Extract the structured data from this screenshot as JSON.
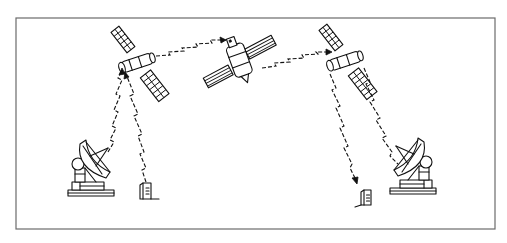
{
  "diagram": {
    "type": "satellite-relay-communication-illustration",
    "frame": {
      "stroke_color": "#6b6b6b",
      "background": "#ffffff"
    },
    "ink_color": "#111111",
    "nodes": [
      {
        "id": "satellite-left",
        "kind": "satellite",
        "label": ""
      },
      {
        "id": "satellite-relay-center",
        "kind": "relay-satellite",
        "label": ""
      },
      {
        "id": "satellite-right",
        "kind": "satellite",
        "label": ""
      },
      {
        "id": "ground-station-left",
        "kind": "dish-antenna",
        "label": ""
      },
      {
        "id": "ground-station-right",
        "kind": "dish-antenna",
        "label": ""
      },
      {
        "id": "terminal-left",
        "kind": "user-terminal",
        "label": ""
      },
      {
        "id": "terminal-right",
        "kind": "user-terminal",
        "label": ""
      }
    ],
    "links": [
      {
        "from": "satellite-left",
        "to": "satellite-relay-center",
        "style": "zigzag-radio"
      },
      {
        "from": "satellite-relay-center",
        "to": "satellite-right",
        "style": "zigzag-radio"
      },
      {
        "from": "ground-station-left",
        "to": "satellite-left",
        "style": "zigzag-radio"
      },
      {
        "from": "terminal-left",
        "to": "satellite-left",
        "style": "zigzag-radio"
      },
      {
        "from": "satellite-right",
        "to": "terminal-right",
        "style": "zigzag-radio"
      },
      {
        "from": "satellite-right",
        "to": "ground-station-right",
        "style": "zigzag-radio"
      }
    ]
  }
}
